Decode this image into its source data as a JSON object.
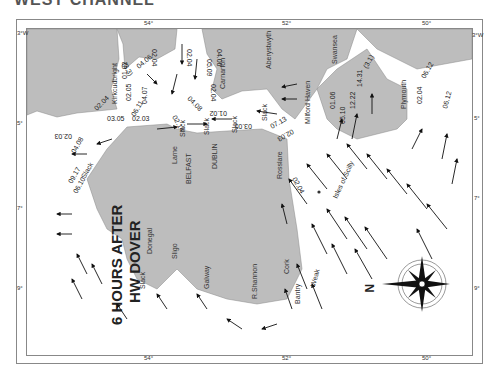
{
  "header": {
    "title": "WEST CHANNEL"
  },
  "map": {
    "title_line1": "6 HOURS AFTER",
    "title_line2": "HW DOVER",
    "compass_label": "N",
    "scale_ticks": {
      "top": [
        "54°",
        "52°",
        "50°"
      ],
      "right": [
        "3°W",
        "5°",
        "7°",
        "9°"
      ],
      "left": [
        "3°W",
        "5°",
        "7°",
        "9°"
      ],
      "bottom": [
        "54°",
        "52°",
        "50°"
      ]
    },
    "places": [
      "Kirkcudbright",
      "Carnarfon",
      "Aberystwyth",
      "Milford Haven",
      "Swansea",
      "Plymouth",
      "Larne",
      "BELFAST",
      "DUBLIN",
      "Rosslare",
      "Donegal",
      "Sligo",
      "Galway",
      "R.Shannon",
      "Cork",
      "Bantry",
      "Isles of Scilly"
    ],
    "slack_labels": [
      "Slack",
      "Slack",
      "Slack",
      "Slack",
      "Slack",
      "Slack",
      "Weak"
    ],
    "rates": [
      "02.04",
      "01.02",
      "(3.3)",
      "04.06",
      "04.07",
      "02.05",
      "06.11",
      "03.05",
      "02.03",
      "02.04",
      "02.04",
      "04.06",
      "05.09",
      "02.04",
      "04.08",
      "02.14",
      "01.02",
      "04.08",
      "02.03",
      "09.17",
      "06.10",
      "03.05",
      "07.13",
      "02.03",
      "02.04",
      "05.10",
      "01.06",
      "12.22",
      "14.31",
      "(3.1)",
      "02.04",
      "06.12",
      "06.12",
      "10.21",
      "05.11",
      "05.12",
      "04.09",
      "03.05",
      "02.03",
      "07.14",
      "02.05",
      "04.07",
      "05.10",
      "00.00",
      "10.21",
      "06.11",
      "06.11",
      "10.20",
      "05.10",
      "02.05"
    ]
  }
}
